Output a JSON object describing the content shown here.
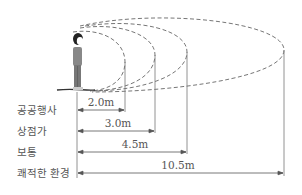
{
  "diagram": {
    "type": "personal-space-distance",
    "rows": [
      {
        "label": "공공행사",
        "distance": "2.0m"
      },
      {
        "label": "상점가",
        "distance": "3.0m"
      },
      {
        "label": "보통",
        "distance": "4.5m"
      },
      {
        "label": "쾌적한 환경",
        "distance": "10.5m"
      }
    ],
    "colors": {
      "line": "#666666",
      "text": "#555555",
      "figure": "#777777"
    }
  }
}
